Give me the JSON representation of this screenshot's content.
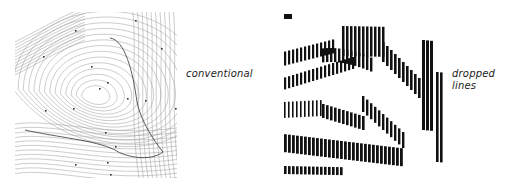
{
  "figure": {
    "panels": [
      {
        "id": "conventional",
        "label": "conventional",
        "description": "contour map with thin continuous contour lines"
      },
      {
        "id": "dropped",
        "label_lines": [
          "dropped",
          "lines"
        ],
        "description": "same terrain rendered with vertical dropped line strokes"
      }
    ],
    "colors": {
      "ink": "#111111",
      "thin_line": "#8a8a8a",
      "background": "#ffffff"
    }
  }
}
